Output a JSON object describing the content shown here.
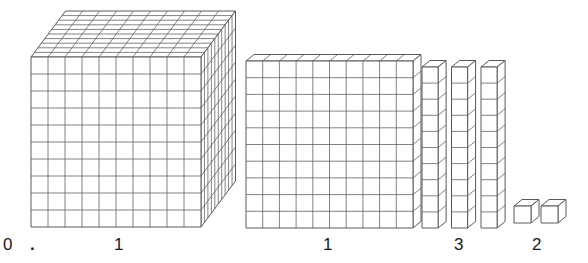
{
  "figure": {
    "number_shown": "0.1132",
    "stroke_color": "#5a5a5a",
    "fill_color": "#ffffff",
    "label_color": "#1a1a1a",
    "background": "#ffffff"
  },
  "labels": [
    {
      "id": "ones",
      "text": "0",
      "x": 3,
      "y": 236
    },
    {
      "id": "decimal",
      "text": ".",
      "x": 30,
      "y": 236
    },
    {
      "id": "tenths",
      "text": "1",
      "x": 114,
      "y": 236
    },
    {
      "id": "hundredths",
      "text": "1",
      "x": 323,
      "y": 236
    },
    {
      "id": "thousandths",
      "text": "3",
      "x": 454,
      "y": 236
    },
    {
      "id": "tenthousandths",
      "text": "2",
      "x": 532,
      "y": 236
    }
  ],
  "groups": [
    {
      "id": "cube-group",
      "name": "thousand-cube",
      "kind": "cube",
      "count": 1,
      "units_per_item": 1000,
      "place": "tenths",
      "digit": "1",
      "origin_x": 31,
      "origin_y": 57,
      "cell": 17.0,
      "rows": 10,
      "cols": 10,
      "depth_dx": 3.45,
      "depth_dy": -4.6,
      "depth_steps": 10
    },
    {
      "id": "flat-group",
      "name": "hundred-flat",
      "kind": "flat",
      "count": 1,
      "units_per_item": 100,
      "place": "hundredths",
      "digit": "1",
      "origin_x": 246,
      "origin_y": 61,
      "cell": 16.7,
      "rows": 10,
      "cols": 10,
      "depth_dx": 8.0,
      "depth_dy": -6.5,
      "depth_steps": 1
    },
    {
      "id": "rods-group",
      "name": "ten-rods",
      "kind": "rod",
      "count": 3,
      "units_per_item": 10,
      "place": "thousandths",
      "digit": "3",
      "origin_x": 422,
      "origin_y": 67,
      "cell": 16.1,
      "rows": 10,
      "cols": 1,
      "spacing": 29.5,
      "depth_dx": 8.0,
      "depth_dy": -6.5,
      "depth_steps": 1
    },
    {
      "id": "units-group",
      "name": "unit-cubes",
      "kind": "unit",
      "count": 2,
      "units_per_item": 1,
      "place": "ten-thousandths",
      "digit": "2",
      "origin_x": 514,
      "origin_y": 206,
      "cell": 17.0,
      "rows": 1,
      "cols": 1,
      "spacing": 27.0,
      "depth_dx": 8.0,
      "depth_dy": -6.5,
      "depth_steps": 1
    }
  ]
}
